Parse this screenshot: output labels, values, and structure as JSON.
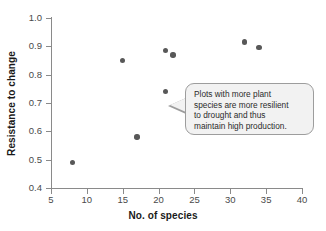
{
  "chart_data": {
    "type": "scatter",
    "title": "",
    "xlabel": "No. of species",
    "ylabel": "Resistance to change",
    "xlim": [
      5,
      40
    ],
    "ylim": [
      0.4,
      1.0
    ],
    "xticks": [
      5,
      10,
      15,
      20,
      25,
      30,
      35,
      40
    ],
    "xtick_labels": [
      "5",
      "10",
      "15",
      "20",
      "25",
      "30",
      "35",
      "40"
    ],
    "yticks": [
      0.4,
      0.5,
      0.6,
      0.7,
      0.8,
      0.9,
      1.0
    ],
    "ytick_labels": [
      "0.4",
      "0.5",
      "0.6",
      "0.7",
      "0.8",
      "0.9",
      "1.0"
    ],
    "grid": false,
    "legend": null,
    "marker": "circle",
    "marker_color": "#585858",
    "points": [
      {
        "x": 8,
        "y": 0.49
      },
      {
        "x": 15,
        "y": 0.85
      },
      {
        "x": 17,
        "y": 0.58
      },
      {
        "x": 21,
        "y": 0.885
      },
      {
        "x": 21,
        "y": 0.74
      },
      {
        "x": 22,
        "y": 0.87
      },
      {
        "x": 32,
        "y": 0.915
      },
      {
        "x": 34,
        "y": 0.895
      }
    ],
    "annotations": [
      {
        "text": "Plots with more plant\nspecies are more resilient\nto drought and thus\nmaintain high production.",
        "style": "speech-bubble",
        "pointer_direction": "left"
      }
    ]
  },
  "axes": {
    "spine_color": "#8a8a8a",
    "tick_label_color": "#4a4a4a",
    "axis_title_color": "#1a1a1a"
  },
  "callout": {
    "text": "Plots with more plant\nspecies are more resilient\nto drought and thus\nmaintain high production.",
    "fill": "#f2f2f2",
    "border": "#9d9d9d"
  },
  "figure": {
    "background": "#ffffff"
  }
}
